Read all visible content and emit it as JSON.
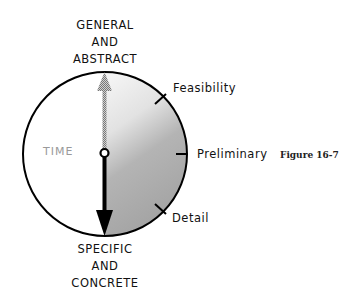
{
  "diagram": {
    "top_label": [
      "GENERAL",
      "AND",
      "ABSTRACT"
    ],
    "bottom_label": [
      "SPECIFIC",
      "AND",
      "CONCRETE"
    ],
    "center_label": "TIME",
    "ticks": [
      {
        "label": "Feasibility",
        "angle_deg": -45
      },
      {
        "label": "Preliminary",
        "angle_deg": 0
      },
      {
        "label": "Detail",
        "angle_deg": 45
      }
    ],
    "caption": "Figure 16-7",
    "colors": {
      "shade_light": "#f2f2f2",
      "shade_dark": "#a8a8a8",
      "outline": "#000000",
      "ghost_arrow": "#9a9a9a",
      "time_text": "#9a9a9a"
    }
  }
}
